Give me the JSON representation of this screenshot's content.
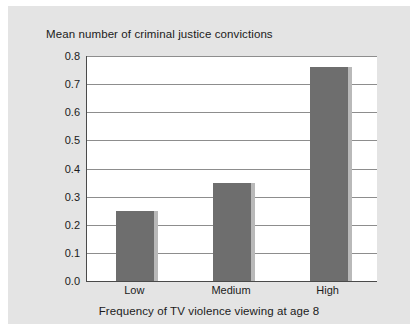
{
  "figure": {
    "background_color": "#e4e4e4",
    "plot_background_color": "#ffffff"
  },
  "chart_data": {
    "type": "bar",
    "title": "Mean number of criminal justice convictions",
    "xlabel": "Frequency of TV violence viewing at age 8",
    "ylabel": "",
    "categories": [
      "Low",
      "Medium",
      "High"
    ],
    "values": [
      0.25,
      0.35,
      0.76
    ],
    "ylim": [
      0.0,
      0.8
    ],
    "ytick_labels": [
      "0.0",
      "0.1",
      "0.2",
      "0.3",
      "0.4",
      "0.5",
      "0.6",
      "0.7",
      "0.8"
    ],
    "ytick_values": [
      0.0,
      0.1,
      0.2,
      0.3,
      0.4,
      0.5,
      0.6,
      0.7,
      0.8
    ],
    "grid": true,
    "grid_axis": "y",
    "legend": false,
    "bar_color": "#6e6e6e",
    "bar_shadow_color": "#b9b9b9",
    "axis_color": "#4a4a4a",
    "gridline_color": "#8d8d8d"
  }
}
